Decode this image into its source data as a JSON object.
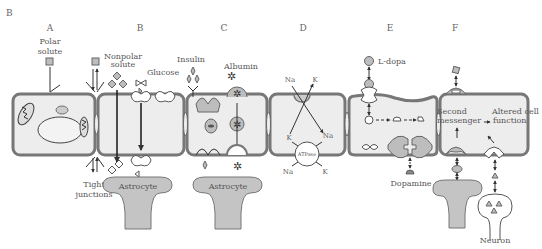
{
  "figure": {
    "label": "B",
    "panels": [
      {
        "id": "A",
        "letter": "A",
        "labels": [
          "Polar",
          "solute"
        ],
        "bottom_labels": [
          "Tight",
          "junctions"
        ]
      },
      {
        "id": "B",
        "letter": "B",
        "labels": {
          "nonpolar": [
            "Nonpolar",
            "solute"
          ],
          "glucose": "Glucose"
        },
        "astrocyte": "Astrocyte"
      },
      {
        "id": "C",
        "letter": "C",
        "labels": {
          "insulin": "Insulin",
          "albumin": "Albumin"
        },
        "astrocyte": "Astrocyte"
      },
      {
        "id": "D",
        "letter": "D",
        "labels": {
          "na_top": "Na",
          "k_top": "K",
          "k_mid": "K",
          "na_mid": "Na",
          "atpase": "ATPase",
          "na_bottom": "Na",
          "k_bottom": "K"
        }
      },
      {
        "id": "E",
        "letter": "E",
        "labels": {
          "ldopa": "L-dopa",
          "dopamine": "Dopamine"
        }
      },
      {
        "id": "F",
        "letter": "F",
        "labels": {
          "second_messenger": [
            "Second",
            "messenger"
          ],
          "altered": [
            "Altered cell",
            "function"
          ],
          "astrocyte": "Astrocyte",
          "neuron": "Neuron"
        }
      }
    ]
  }
}
